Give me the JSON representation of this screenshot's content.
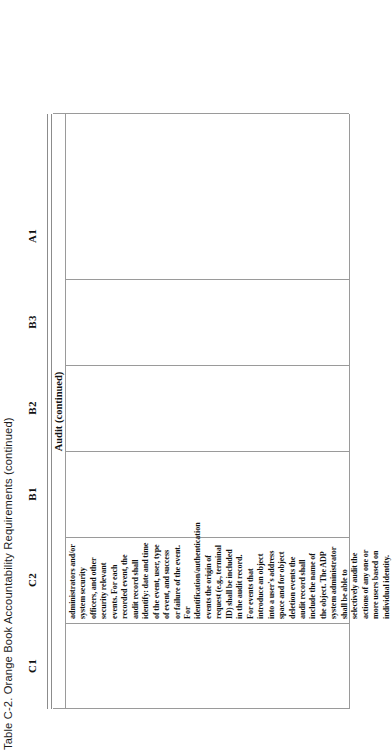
{
  "caption": {
    "text": "Table C-2.  Orange Book Accountability Requirements (continued)"
  },
  "table": {
    "column_headers": [
      "C1",
      "C2",
      "B1",
      "B2",
      "B3",
      "A1"
    ],
    "band_label": "Audit (continued)",
    "cells": {
      "C1": "",
      "C2": "administrators and/or system security officers, and other security relevant events.  For each recorded event, the audit record shall identify:  date and time of the event, user, type of event, and success or failure of the event.  For identification/authentication events the origin of request (e.g., terminal ID) shall be included in the audit record.  For events that introduce an object into a user's address space and for object deletion events the audit record shall include the name of the object.  The ADP system administrator shall be able to selectively audit the actions of any one or more users based on individual identity.",
      "B1": "",
      "B2": "",
      "B3": "",
      "A1": ""
    }
  },
  "colors": {
    "rule": "#9a9a9a",
    "text": "#121212",
    "page_background": "#ffffff"
  }
}
